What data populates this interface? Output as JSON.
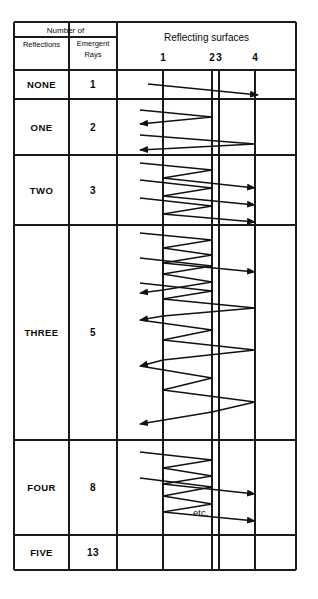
{
  "figure": {
    "title_header": {
      "group_label": "Number  of",
      "col1": "Reflections",
      "col2_line1": "Emergent",
      "col2_line2": "Rays",
      "diagram_header": "Reflecting  surfaces"
    },
    "surface_ticks": [
      {
        "label": "1",
        "x": 163
      },
      {
        "label": "2",
        "x": 212
      },
      {
        "label": "3",
        "x": 219
      },
      {
        "label": "4",
        "x": 255
      }
    ],
    "rows": [
      {
        "reflections": "NONE",
        "emergent_rays": "1",
        "top": 70,
        "bottom": 99
      },
      {
        "reflections": "ONE",
        "emergent_rays": "2",
        "top": 99,
        "bottom": 155
      },
      {
        "reflections": "TWO",
        "emergent_rays": "3",
        "top": 155,
        "bottom": 225
      },
      {
        "reflections": "THREE",
        "emergent_rays": "5",
        "top": 225,
        "bottom": 440
      },
      {
        "reflections": "FOUR",
        "emergent_rays": "8",
        "top": 440,
        "bottom": 535
      },
      {
        "reflections": "FIVE",
        "emergent_rays": "13",
        "top": 535,
        "bottom": 570
      }
    ],
    "annotation": {
      "etc_label": "etc."
    },
    "colors": {
      "ink": "#111111",
      "paper": "#ffffff",
      "rule": "#1a1a1a"
    },
    "frame": {
      "left": 14,
      "right": 296,
      "top": 22,
      "bottom": 570,
      "col1_right": 69,
      "col2_right": 117,
      "diagram_left": 117
    },
    "ray_paths": {
      "none": [
        [
          [
            148,
            84
          ],
          [
            258,
            95
          ]
        ]
      ],
      "one": [
        [
          [
            140,
            110
          ],
          [
            212,
            117
          ],
          [
            140,
            124
          ]
        ],
        [
          [
            140,
            135
          ],
          [
            255,
            144
          ],
          [
            140,
            150
          ]
        ]
      ],
      "two": [
        [
          [
            140,
            163
          ],
          [
            212,
            170
          ],
          [
            163,
            178
          ],
          [
            255,
            188
          ]
        ],
        [
          [
            140,
            180
          ],
          [
            212,
            188
          ],
          [
            163,
            196
          ],
          [
            255,
            205
          ]
        ],
        [
          [
            140,
            198
          ],
          [
            212,
            206
          ],
          [
            163,
            214
          ],
          [
            255,
            222
          ]
        ]
      ],
      "three": [
        [
          [
            140,
            233
          ],
          [
            212,
            240
          ],
          [
            163,
            248
          ],
          [
            212,
            255
          ],
          [
            163,
            263
          ],
          [
            255,
            272
          ]
        ],
        [
          [
            140,
            258
          ],
          [
            212,
            266
          ],
          [
            163,
            274
          ],
          [
            212,
            282
          ],
          [
            163,
            290
          ],
          [
            140,
            293
          ]
        ],
        [
          [
            140,
            283
          ],
          [
            212,
            291
          ],
          [
            163,
            299
          ],
          [
            255,
            308
          ],
          [
            163,
            316
          ],
          [
            140,
            320
          ]
        ],
        [
          [
            140,
            320
          ],
          [
            212,
            330
          ],
          [
            163,
            340
          ],
          [
            255,
            350
          ],
          [
            163,
            360
          ],
          [
            140,
            366
          ]
        ],
        [
          [
            140,
            366
          ],
          [
            212,
            378
          ],
          [
            163,
            390
          ],
          [
            255,
            402
          ],
          [
            212,
            412
          ],
          [
            140,
            424
          ]
        ]
      ],
      "four": [
        [
          [
            140,
            452
          ],
          [
            212,
            460
          ],
          [
            163,
            468
          ],
          [
            212,
            476
          ],
          [
            163,
            484
          ],
          [
            255,
            494
          ]
        ],
        [
          [
            140,
            478
          ],
          [
            212,
            487
          ],
          [
            163,
            496
          ],
          [
            212,
            504
          ],
          [
            163,
            512
          ],
          [
            255,
            521
          ]
        ]
      ]
    }
  }
}
